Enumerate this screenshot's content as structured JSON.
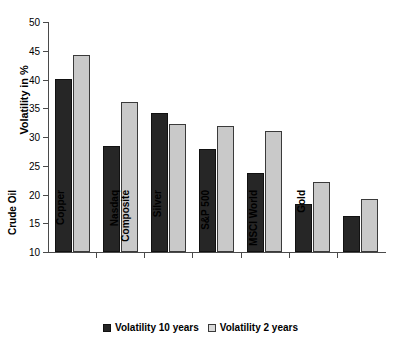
{
  "chart_data": {
    "type": "bar",
    "title": "",
    "xlabel": "",
    "ylabel": "Volatility in %",
    "ylim": [
      10,
      50
    ],
    "ytick_step": 5,
    "yticks": [
      10,
      15,
      20,
      25,
      30,
      35,
      40,
      45,
      50
    ],
    "grid": false,
    "legend_position": "bottom-center",
    "categories": [
      "Crude Oil",
      "Nasdaq Composite",
      "Copper",
      "Silver",
      "S&P 500",
      "MSCI World",
      "Gold"
    ],
    "categories_display_order": [
      "Crude Oil",
      "Copper",
      "Nasdaq Composite",
      "Silver",
      "S&P 500",
      "MSCI World",
      "Gold"
    ],
    "series": [
      {
        "name": "Volatility 10 years",
        "color": "#262626",
        "values": [
          40.1,
          34.1,
          28.5,
          28.0,
          23.7,
          18.4,
          16.2
        ]
      },
      {
        "name": "Volatility 2 years",
        "color": "#c9c9c9",
        "values": [
          44.2,
          32.3,
          36.1,
          32.0,
          31.1,
          22.2,
          19.3
        ]
      }
    ]
  },
  "axis": {
    "y_title": "Volatility in %"
  },
  "legend": {
    "items": [
      {
        "label": "Volatility 10 years",
        "swatch": "dark"
      },
      {
        "label": "Volatility 2 years",
        "swatch": "light"
      }
    ]
  },
  "colors": {
    "series_10y": "#262626",
    "series_2y": "#c9c9c9",
    "axis": "#4a4a4a",
    "background": "#ffffff"
  }
}
